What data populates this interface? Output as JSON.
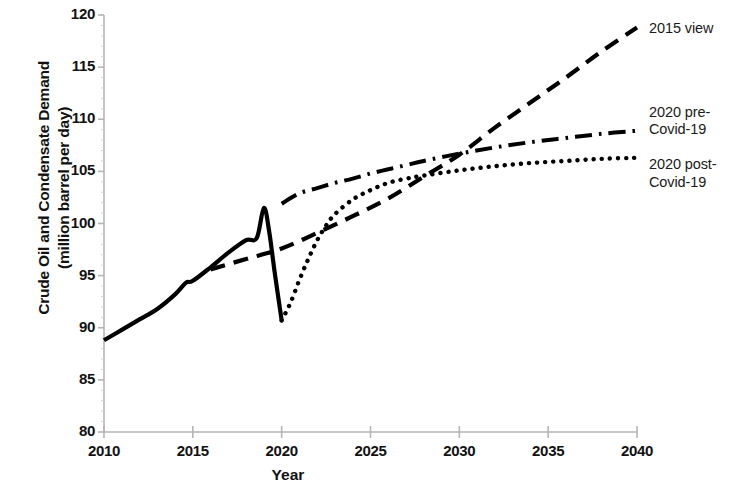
{
  "chart_data": {
    "type": "line",
    "title": "",
    "xlabel": "Year",
    "ylabel": "Crude Oil and Condensate Demand\n(million barrel per day)",
    "xlim": [
      2010,
      2040
    ],
    "ylim": [
      80,
      120
    ],
    "xticks": [
      2010,
      2015,
      2020,
      2025,
      2030,
      2035,
      2040
    ],
    "yticks": [
      80,
      85,
      90,
      95,
      100,
      105,
      110,
      115,
      120
    ],
    "grid": false,
    "legend_position": "right-inline-labels",
    "series": [
      {
        "name": "Historical",
        "style": "solid",
        "color": "#000000",
        "x": [
          2010,
          2011,
          2012,
          2013,
          2014,
          2014.6,
          2015,
          2016,
          2017,
          2018,
          2018.6,
          2019,
          2019.3,
          2019.6,
          2020
        ],
        "y": [
          88.8,
          89.8,
          90.8,
          91.8,
          93.2,
          94.3,
          94.5,
          95.8,
          97.2,
          98.4,
          98.6,
          101.5,
          99.2,
          95.4,
          90.7
        ]
      },
      {
        "name": "2015 view",
        "style": "dashed",
        "color": "#000000",
        "x": [
          2016,
          2018,
          2020,
          2022,
          2024,
          2026,
          2028,
          2030,
          2032,
          2034,
          2036,
          2038,
          2040
        ],
        "y": [
          95.6,
          96.6,
          97.6,
          99.1,
          100.7,
          102.4,
          104.5,
          106.6,
          109.2,
          111.6,
          114.0,
          116.5,
          118.8
        ]
      },
      {
        "name": "2020 pre-Covid-19",
        "style": "dash-dot",
        "color": "#000000",
        "x": [
          2020,
          2021,
          2022,
          2023,
          2024,
          2025,
          2026,
          2027,
          2028,
          2030,
          2032,
          2034,
          2036,
          2038,
          2040
        ],
        "y": [
          101.9,
          102.9,
          103.4,
          103.9,
          104.3,
          104.8,
          105.2,
          105.6,
          106.0,
          106.7,
          107.3,
          107.8,
          108.2,
          108.6,
          108.9
        ]
      },
      {
        "name": "2020 post-Covid-19",
        "style": "dotted",
        "color": "#000000",
        "x": [
          2020,
          2020.5,
          2021,
          2021.5,
          2022,
          2022.5,
          2023,
          2024,
          2025,
          2026,
          2027,
          2028,
          2030,
          2032,
          2034,
          2036,
          2038,
          2040
        ],
        "y": [
          90.7,
          92.4,
          94.6,
          96.6,
          98.4,
          99.8,
          100.9,
          102.3,
          103.2,
          103.9,
          104.3,
          104.6,
          105.1,
          105.5,
          105.8,
          106.0,
          106.2,
          106.3
        ]
      }
    ],
    "annotations": [
      {
        "text": "2015 view",
        "at_x": 2040,
        "at_y": 118.8
      },
      {
        "text": "2020 pre-\nCovid-19",
        "at_x": 2040,
        "at_y": 108.9
      },
      {
        "text": "2020 post-\nCovid-19",
        "at_x": 2040,
        "at_y": 106.3
      }
    ]
  },
  "axes": {
    "y_tick_labels": [
      "120",
      "115",
      "110",
      "105",
      "100",
      "95",
      "90",
      "85",
      "80"
    ],
    "x_tick_labels": [
      "2010",
      "2015",
      "2020",
      "2025",
      "2030",
      "2035",
      "2040"
    ],
    "x_axis_title": "Year",
    "y_axis_title": "Crude Oil and Condensate Demand\n(million barrel per day)"
  },
  "labels": {
    "view2015": "2015 view",
    "pre_covid": "2020 pre-\nCovid-19",
    "post_covid": "2020 post-\nCovid-19"
  },
  "colors": {
    "line": "#000000",
    "axis": "#b5b5b5",
    "text": "#111111"
  }
}
